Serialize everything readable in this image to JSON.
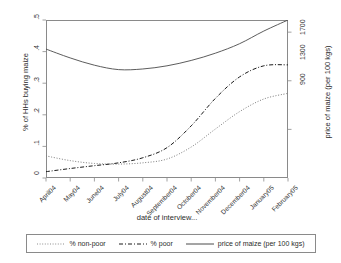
{
  "chart_data": {
    "type": "line",
    "title": "",
    "xlabel": "date of interview...",
    "ylabel": "% of HHs buying maize",
    "ylabel_right": "price of maize (per 100 kgs)",
    "categories": [
      "April04",
      "May04",
      "June04",
      "July04",
      "August04",
      "September04",
      "October04",
      "November04",
      "December04",
      "January05",
      "February05"
    ],
    "ylim": [
      0,
      0.5
    ],
    "yticks": [
      "0",
      ".1",
      ".2",
      ".3",
      ".4",
      ".5"
    ],
    "ytick_values": [
      0,
      0.1,
      0.2,
      0.3,
      0.4,
      0.5
    ],
    "ylim_right": [
      500,
      1800
    ],
    "yticks_right": [
      "900",
      "1300",
      "1700"
    ],
    "ytick_right_values": [
      900,
      1300,
      1700
    ],
    "grid": false,
    "legend_position": "bottom",
    "series": [
      {
        "name": "% non-poor",
        "style": "dotted",
        "color": "#7d7d7d",
        "axis": "left",
        "values": [
          0.07,
          0.055,
          0.046,
          0.044,
          0.048,
          0.06,
          0.098,
          0.155,
          0.21,
          0.25,
          0.268
        ]
      },
      {
        "name": "% poor",
        "style": "dash-dot",
        "color": "#1a1a1a",
        "axis": "left",
        "values": [
          0.02,
          0.03,
          0.039,
          0.048,
          0.064,
          0.096,
          0.165,
          0.252,
          0.32,
          0.355,
          0.358
        ]
      },
      {
        "name": "price of maize (per 100 kgs)",
        "style": "solid",
        "color": "#4a4a4a",
        "axis": "right",
        "values": [
          1570,
          1470,
          1400,
          1375,
          1390,
          1430,
          1480,
          1540,
          1610,
          1700,
          1800
        ],
        "values_left_scale": [
          0.408,
          0.38,
          0.357,
          0.343,
          0.345,
          0.355,
          0.372,
          0.395,
          0.425,
          0.465,
          0.5
        ]
      }
    ],
    "legend": [
      {
        "label": "% non-poor",
        "style": "dotted"
      },
      {
        "label": "% poor",
        "style": "dash-dot"
      },
      {
        "label": "price of maize (per 100 kgs)",
        "style": "solid"
      }
    ]
  }
}
